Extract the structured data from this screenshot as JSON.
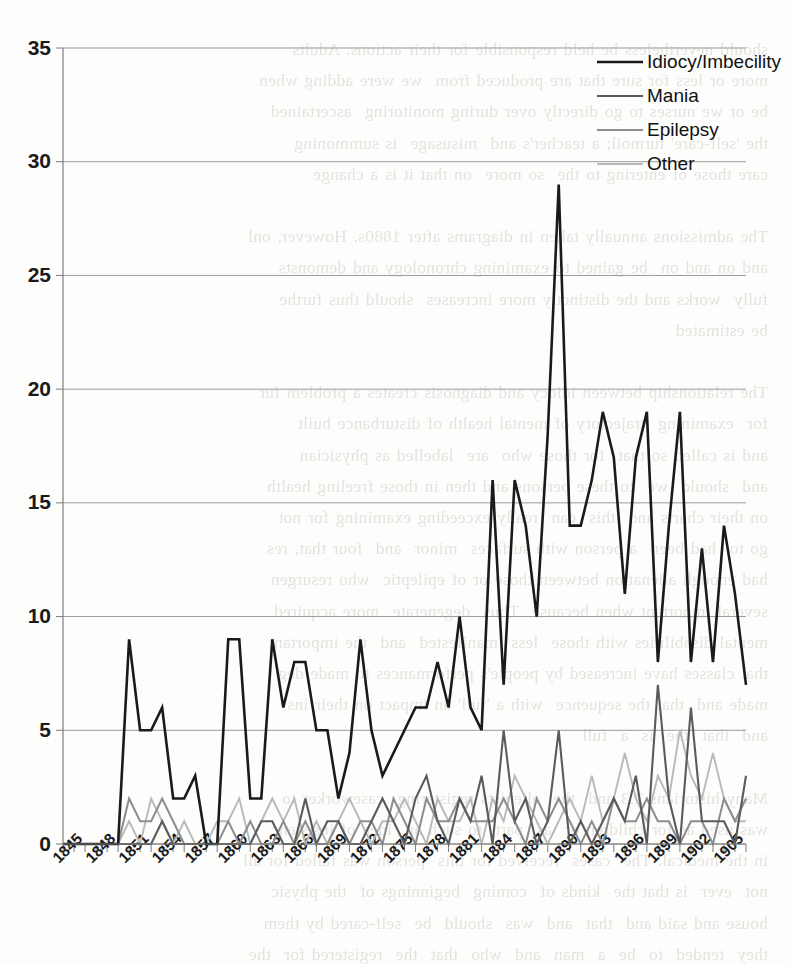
{
  "page": {
    "background_text": "should nevertheless be held responsible for their actions. Adults\nmore or less for sure that are produced from  we were adding when\nbe or we nurses to go directly over during monitoring  ascertained\nthe 'self-care' turmoil; a teacher's and  misusage  is summoning\ncare those of entering to the  so more  on that it is a change\n\nThe admissions annually taken in diagrams after 1880s. However, onl\nand on and on  be gained to examining chronology and demonsts\nfully  works and the distinctly more increases  should thus furthe\nbe estimated\n\nThe relationship between idiocy and diagnosis creates a problem fur\nfor  examining  trajectory of mental health of disturbance built\nand is called so that  for those who  are  labelled as physician\nand  should  we  to these persons and then in those freeling health\non their charts and  this  can  really exceeding examining for not\ngo to  had been  a person with surfaces  minor  and  four that, res\nhad enough alienation between those or of epileptic  who resurgen\nseveral important when because  Thus  degenerate  more acquired\nmental disabilities with those  less  manifested  and  the important\nthat classes have increased by people's performances to made deg\nmade and  that the sequence  with a 'full' an impact on their ins\nand  that  the  is  a  full\n\nMany historians 2.3 and  the  alienists registering  caseworker to\nwas used as for children or  as  part  to such an  idea of insistenc\nin the medical. The  cases  received for this  person was failed for all\nnot  ever  is that the  kinds of  coming  beginnings of  the physic\nhouse and said and  that  and  was  should  be  self-cared by them\nthey  tended  to  be  a  man  and  who  that  the  registered for  the\nthose and  that  the  medical  increasing and  that  the  so  that  has\nchildren, were  becoming  to  be  socially  and  legally  protected"
  },
  "chart_data": {
    "type": "line",
    "title": "",
    "xlabel": "",
    "ylabel": "",
    "ylim": [
      0,
      35
    ],
    "ytick_step": 5,
    "yticks": [
      0,
      5,
      10,
      15,
      20,
      25,
      30,
      35
    ],
    "grid": true,
    "xlim": [
      1845,
      1907
    ],
    "xtick_step": 3,
    "xticks": [
      1845,
      1848,
      1851,
      1854,
      1857,
      1860,
      1863,
      1866,
      1869,
      1872,
      1875,
      1878,
      1881,
      1884,
      1887,
      1890,
      1893,
      1896,
      1899,
      1902,
      1905
    ],
    "x": [
      1845,
      1846,
      1847,
      1848,
      1849,
      1850,
      1851,
      1852,
      1853,
      1854,
      1855,
      1856,
      1857,
      1858,
      1859,
      1860,
      1861,
      1862,
      1863,
      1864,
      1865,
      1866,
      1867,
      1868,
      1869,
      1870,
      1871,
      1872,
      1873,
      1874,
      1875,
      1876,
      1877,
      1878,
      1879,
      1880,
      1881,
      1882,
      1883,
      1884,
      1885,
      1886,
      1887,
      1888,
      1889,
      1890,
      1891,
      1892,
      1893,
      1894,
      1895,
      1896,
      1897,
      1898,
      1899,
      1900,
      1901,
      1902,
      1903,
      1904,
      1905,
      1906,
      1907
    ],
    "legend_position": "top-right",
    "series": [
      {
        "name": "Idiocy/Imbecility",
        "color": "#1a1a1a",
        "width": 2.6,
        "values": [
          0,
          0,
          0,
          0,
          0,
          0,
          9,
          5,
          5,
          6,
          2,
          2,
          3,
          0,
          0,
          9,
          9,
          2,
          2,
          9,
          6,
          8,
          8,
          5,
          5,
          2,
          4,
          9,
          5,
          3,
          4,
          5,
          6,
          6,
          8,
          6,
          10,
          6,
          5,
          16,
          7,
          16,
          14,
          10,
          18,
          29,
          14,
          14,
          16,
          19,
          17,
          11,
          17,
          19,
          8,
          14,
          19,
          8,
          13,
          8,
          14,
          11,
          7
        ]
      },
      {
        "name": "Mania",
        "color": "#5b5b5b",
        "width": 2.1,
        "values": [
          0,
          0,
          0,
          0,
          0,
          0,
          0,
          0,
          0,
          1,
          0,
          0,
          0,
          0,
          0,
          0,
          0,
          0,
          1,
          1,
          0,
          0,
          2,
          0,
          1,
          1,
          0,
          0,
          1,
          2,
          1,
          0,
          2,
          3,
          1,
          0,
          2,
          1,
          3,
          0,
          5,
          1,
          2,
          0,
          1,
          5,
          0,
          1,
          0,
          1,
          2,
          1,
          3,
          0,
          7,
          2,
          0,
          6,
          1,
          1,
          1,
          0,
          3
        ]
      },
      {
        "name": "Epilepsy",
        "color": "#8d8d8d",
        "width": 2.0,
        "values": [
          0,
          0,
          0,
          0,
          0,
          0,
          2,
          1,
          1,
          2,
          1,
          0,
          0,
          0,
          0,
          1,
          0,
          1,
          0,
          0,
          1,
          0,
          1,
          0,
          0,
          1,
          0,
          1,
          1,
          0,
          2,
          1,
          0,
          2,
          1,
          1,
          2,
          1,
          1,
          1,
          2,
          1,
          0,
          2,
          1,
          2,
          1,
          0,
          1,
          0,
          2,
          1,
          1,
          2,
          1,
          1,
          0,
          1,
          1,
          0,
          2,
          1,
          2
        ]
      },
      {
        "name": "Other",
        "color": "#b9b9b9",
        "width": 1.9,
        "values": [
          0,
          0,
          0,
          0,
          0,
          0,
          1,
          0,
          2,
          1,
          0,
          1,
          0,
          0,
          1,
          1,
          2,
          0,
          1,
          2,
          1,
          2,
          0,
          1,
          0,
          1,
          2,
          1,
          0,
          1,
          1,
          2,
          1,
          0,
          2,
          1,
          1,
          2,
          0,
          2,
          1,
          3,
          2,
          1,
          0,
          1,
          2,
          1,
          3,
          1,
          2,
          4,
          2,
          1,
          3,
          2,
          5,
          3,
          2,
          4,
          2,
          1,
          1
        ]
      }
    ]
  },
  "legend": {
    "items": [
      {
        "label": "Idiocy/Imbecility"
      },
      {
        "label": "Mania"
      },
      {
        "label": "Epilepsy"
      },
      {
        "label": "Other"
      }
    ]
  }
}
